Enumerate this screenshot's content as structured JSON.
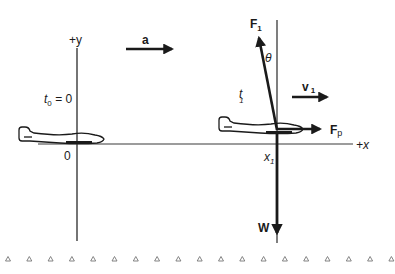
{
  "diagram": {
    "title": "",
    "axes": {
      "y_label": "+y",
      "x_label": "+x",
      "origin_label": "0"
    },
    "time_labels": {
      "t0": "t",
      "t0_sub": "0",
      "t0_value": " = 0",
      "t1": "t",
      "t1_sub": "1"
    },
    "position_label": {
      "x": "x",
      "sub": "1"
    },
    "vectors": {
      "acceleration": "a",
      "velocity": "v",
      "velocity_sub": "1",
      "lift_force": "F",
      "lift_force_sub": "1",
      "propulsion_force": "F",
      "propulsion_force_sub": "p",
      "weight": "W",
      "angle": "θ"
    },
    "ground_marker_count": 19,
    "colors": {
      "ink": "#1a1a1a",
      "axis": "#3a3a3a",
      "ground": "#777777"
    }
  }
}
